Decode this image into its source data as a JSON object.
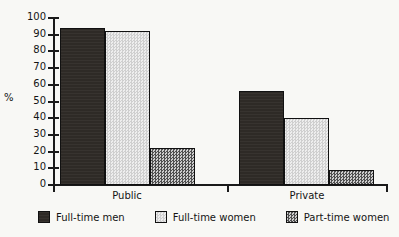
{
  "chart_data": {
    "type": "bar",
    "title": "",
    "xlabel": "",
    "ylabel": "%",
    "ylim": [
      0,
      100
    ],
    "ytick_step": 10,
    "grid": false,
    "legend_position": "bottom",
    "categories": [
      "Public",
      "Private"
    ],
    "series": [
      {
        "name": "Full-time men",
        "values": [
          94,
          56
        ],
        "color": "#2e2a26"
      },
      {
        "name": "Full-time women",
        "values": [
          92,
          40
        ],
        "color": "#d9d9d9"
      },
      {
        "name": "Part-time women",
        "values": [
          22,
          9
        ],
        "color": "#8d8d8d"
      }
    ],
    "ytick_labels": [
      "100",
      "90",
      "80",
      "70",
      "60",
      "50",
      "40",
      "30",
      "20",
      "10",
      "0"
    ]
  },
  "axis": {
    "y_title": "%",
    "ticks": [
      {
        "value": 100,
        "label": "100"
      },
      {
        "value": 90,
        "label": "90"
      },
      {
        "value": 80,
        "label": "80"
      },
      {
        "value": 70,
        "label": "70"
      },
      {
        "value": 60,
        "label": "60"
      },
      {
        "value": 50,
        "label": "50"
      },
      {
        "value": 40,
        "label": "40"
      },
      {
        "value": 30,
        "label": "30"
      },
      {
        "value": 20,
        "label": "20"
      },
      {
        "value": 10,
        "label": "10"
      },
      {
        "value": 0,
        "label": "0"
      }
    ]
  },
  "categories": [
    {
      "label": "Public"
    },
    {
      "label": "Private"
    }
  ],
  "legend": {
    "items": [
      {
        "label": "Full-time men",
        "swatch": "dark"
      },
      {
        "label": "Full-time women",
        "swatch": "light"
      },
      {
        "label": "Part-time women",
        "swatch": "mid"
      }
    ]
  }
}
